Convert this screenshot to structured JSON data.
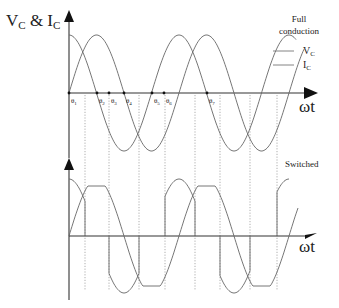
{
  "top_chart": {
    "ylabel_main": "V",
    "ylabel_sub1": "C",
    "ylabel_amp": " & I",
    "ylabel_sub2": "C",
    "xlabel": "ωt",
    "legend_title_line1": "Full",
    "legend_title_line2": "conduction",
    "legend": [
      {
        "main": "V",
        "sub": "C"
      },
      {
        "main": "I",
        "sub": "C"
      }
    ],
    "theta_labels": [
      {
        "main": "θ",
        "sub": "1",
        "x": 71
      },
      {
        "main": "θ",
        "sub": "2",
        "x": 99
      },
      {
        "main": "θ",
        "sub": "3",
        "x": 111
      },
      {
        "main": "θ",
        "sub": "4",
        "x": 126
      },
      {
        "main": "θ",
        "sub": "5",
        "x": 154
      },
      {
        "main": "θ",
        "sub": "6",
        "x": 166
      },
      {
        "main": "θ",
        "sub": "7",
        "x": 209
      }
    ]
  },
  "bottom_chart": {
    "label": "Switched",
    "xlabel": "ωt"
  },
  "geometry": {
    "origin_x": 69,
    "period_px": 110,
    "top_axis_y": 93,
    "top_amp": 58,
    "bottom_axis_y": 236,
    "bottom_amp": 57,
    "bottom_flat": 50,
    "x_end": 300,
    "dotted_x": [
      85,
      109,
      139,
      165,
      195,
      220,
      250,
      277
    ],
    "theta_marks_x": [
      69,
      97,
      109,
      124,
      152,
      164,
      207
    ]
  },
  "chart_data": {
    "type": "line",
    "xlabel": "ωt",
    "ylabel": "V_C & I_C",
    "series": [
      {
        "name": "V_C (full conduction)",
        "shape": "cosine",
        "amplitude": 1.0,
        "cycles": 2.1
      },
      {
        "name": "I_C (full conduction)",
        "shape": "sine",
        "amplitude": 1.0,
        "cycles": 2.1
      },
      {
        "name": "Switched V_C",
        "shape": "cosine segments gated at θ points",
        "amplitude": 1.0
      },
      {
        "name": "Switched I_C",
        "shape": "clamped sine (flat top at ~0.88)",
        "amplitude": 0.88
      }
    ],
    "annotations": [
      "θ1",
      "θ2",
      "θ3",
      "θ4",
      "θ5",
      "θ6",
      "θ7",
      "Full conduction",
      "Switched"
    ],
    "grid": false
  }
}
